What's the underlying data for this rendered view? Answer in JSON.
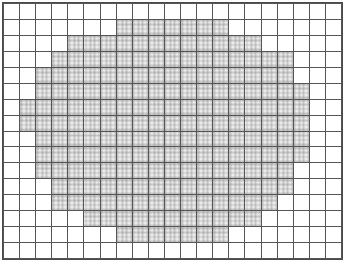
{
  "figure": {
    "kind": "shaded-grid",
    "columns": 21,
    "rows": 16,
    "cell_width_px": 16.2,
    "cell_height_px": 16.1
  },
  "colors": {
    "background": "#ffffff",
    "grid_line": "#555555",
    "frame_line": "#4a4a4a",
    "shaded_fill": "#ebebeb",
    "shaded_texture": "#787878"
  },
  "chart_data": {
    "type": "heatmap",
    "title": "",
    "subtitle": "",
    "xlabel": "",
    "ylabel": "",
    "legend": [],
    "annotations": [],
    "grid": true,
    "legend_position": "none",
    "categories_x": [
      "1",
      "2",
      "3",
      "4",
      "5",
      "6",
      "7",
      "8",
      "9",
      "10",
      "11",
      "12",
      "13",
      "14",
      "15",
      "16",
      "17",
      "18",
      "19",
      "20",
      "21"
    ],
    "categories_y": [
      "1",
      "2",
      "3",
      "4",
      "5",
      "6",
      "7",
      "8",
      "9",
      "10",
      "11",
      "12",
      "13",
      "14",
      "15",
      "16"
    ],
    "value_levels": {
      "0": "unshaded (white)",
      "1": "shaded (light grey)"
    },
    "xlim": [
      0,
      21
    ],
    "ylim": [
      0,
      16
    ],
    "values": [
      [
        0,
        0,
        0,
        0,
        0,
        0,
        0,
        0,
        0,
        0,
        0,
        0,
        0,
        0,
        0,
        0,
        0,
        0,
        0,
        0,
        0
      ],
      [
        0,
        0,
        0,
        0,
        0,
        0,
        0,
        1,
        1,
        1,
        1,
        1,
        1,
        1,
        0,
        0,
        0,
        0,
        0,
        0,
        0
      ],
      [
        0,
        0,
        0,
        0,
        1,
        1,
        1,
        1,
        1,
        1,
        1,
        1,
        1,
        1,
        1,
        1,
        0,
        0,
        0,
        0,
        0
      ],
      [
        0,
        0,
        0,
        1,
        1,
        1,
        1,
        1,
        1,
        1,
        1,
        1,
        1,
        1,
        1,
        1,
        1,
        1,
        0,
        0,
        0
      ],
      [
        0,
        0,
        1,
        1,
        1,
        1,
        1,
        1,
        1,
        1,
        1,
        1,
        1,
        1,
        1,
        1,
        1,
        1,
        0,
        0,
        0
      ],
      [
        0,
        0,
        1,
        1,
        1,
        1,
        1,
        1,
        1,
        1,
        1,
        1,
        1,
        1,
        1,
        1,
        1,
        1,
        1,
        0,
        0
      ],
      [
        0,
        1,
        1,
        1,
        1,
        1,
        1,
        1,
        1,
        1,
        1,
        1,
        1,
        1,
        1,
        1,
        1,
        1,
        1,
        0,
        0
      ],
      [
        0,
        1,
        1,
        1,
        1,
        1,
        1,
        1,
        1,
        1,
        1,
        1,
        1,
        1,
        1,
        1,
        1,
        1,
        1,
        0,
        0
      ],
      [
        0,
        0,
        1,
        1,
        1,
        1,
        1,
        1,
        1,
        1,
        1,
        1,
        1,
        1,
        1,
        1,
        1,
        1,
        1,
        0,
        0
      ],
      [
        0,
        0,
        1,
        1,
        1,
        1,
        1,
        1,
        1,
        1,
        1,
        1,
        1,
        1,
        1,
        1,
        1,
        1,
        1,
        0,
        0
      ],
      [
        0,
        0,
        1,
        1,
        1,
        1,
        1,
        1,
        1,
        1,
        1,
        1,
        1,
        1,
        1,
        1,
        1,
        1,
        0,
        0,
        0
      ],
      [
        0,
        0,
        0,
        1,
        1,
        1,
        1,
        1,
        1,
        1,
        1,
        1,
        1,
        1,
        1,
        1,
        1,
        1,
        0,
        0,
        0
      ],
      [
        0,
        0,
        0,
        1,
        1,
        1,
        1,
        1,
        1,
        1,
        1,
        1,
        1,
        1,
        1,
        1,
        1,
        0,
        0,
        0,
        0
      ],
      [
        0,
        0,
        0,
        0,
        0,
        1,
        1,
        1,
        1,
        1,
        1,
        1,
        1,
        1,
        1,
        1,
        0,
        0,
        0,
        0,
        0
      ],
      [
        0,
        0,
        0,
        0,
        0,
        0,
        0,
        1,
        1,
        1,
        1,
        1,
        1,
        1,
        0,
        0,
        0,
        0,
        0,
        0,
        0
      ],
      [
        0,
        0,
        0,
        0,
        0,
        0,
        0,
        0,
        0,
        0,
        0,
        0,
        0,
        0,
        0,
        0,
        0,
        0,
        0,
        0,
        0
      ]
    ]
  }
}
